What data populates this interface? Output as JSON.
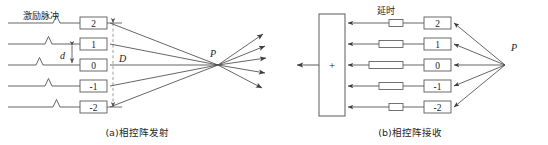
{
  "figure": {
    "width": 548,
    "height": 145,
    "background": "#ffffff",
    "line_color": "#4a4a4a",
    "box_stroke": "#5a5a5a",
    "text_color": "#262626",
    "dashed_color": "#8a8a8a"
  },
  "panel_a": {
    "caption": "(a)相控阵发射",
    "excitation_label": "激励脉冲",
    "aperture_label": "D",
    "pitch_label": "d",
    "focus_label": "P",
    "element_labels": [
      "2",
      "1",
      "0",
      "-1",
      "-2"
    ],
    "element_rows_y": [
      23,
      44,
      65,
      86,
      107
    ],
    "pulse_x": [
      55,
      47,
      38,
      47,
      55
    ],
    "focus_point": [
      218,
      65
    ],
    "aperture_x": 113,
    "box_x": 80,
    "box_w": 27,
    "box_h": 12,
    "fanout_count": 5
  },
  "panel_b": {
    "caption": "(b)相控阵接收",
    "delay_label": "延时",
    "sum_symbol": "+",
    "source_label": "P",
    "element_labels": [
      "2",
      "1",
      "0",
      "-1",
      "-2"
    ],
    "element_rows_y": [
      23,
      44,
      65,
      86,
      107
    ],
    "delay_widths": [
      14,
      24,
      34,
      24,
      14
    ],
    "source_point": [
      505,
      65
    ],
    "summer": {
      "x": 319,
      "y": 14,
      "w": 26,
      "h": 102
    },
    "box_x": 424,
    "box_w": 27,
    "box_h": 12
  }
}
